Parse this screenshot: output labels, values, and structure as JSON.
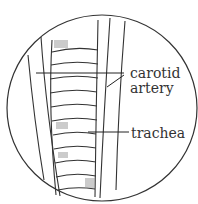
{
  "diagram": {
    "labels": {
      "carotid_line1": "carotid",
      "carotid_line2": "artery",
      "trachea": "trachea"
    },
    "colors": {
      "ink": "#333333",
      "shade": "#777777",
      "background": "#ffffff"
    }
  }
}
